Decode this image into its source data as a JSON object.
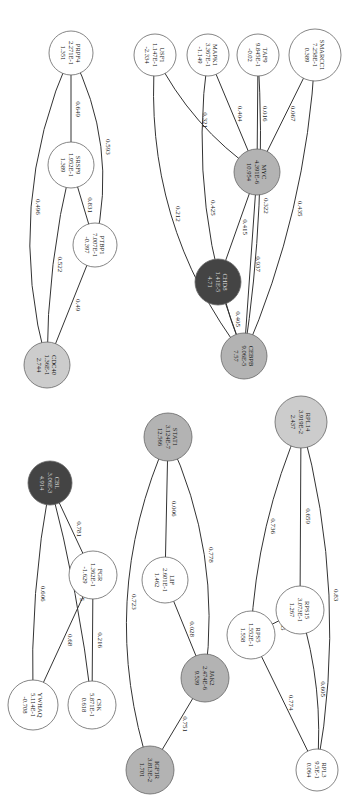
{
  "diagram": {
    "title": "",
    "orientation": "rotated-90",
    "colors": {
      "white": "#ffffff",
      "light": "#cccccc",
      "gray": "#b3b3b3",
      "dark": "#444444",
      "text_dark": "#111111",
      "text_light": "#dddddd"
    },
    "nodes": [
      {
        "id": "PRPF4",
        "pvalue": "2.271E-1",
        "score": "1.351",
        "fill": "white"
      },
      {
        "id": "SRSF9",
        "pvalue": "1.952E-1",
        "score": "1.389",
        "fill": "white"
      },
      {
        "id": "PTBP1",
        "pvalue": "7.007E-1",
        "score": "-0.397",
        "fill": "white"
      },
      {
        "id": "CDC40",
        "pvalue": "1.36E-1",
        "score": "2.744",
        "fill": "light"
      },
      {
        "id": "USF1",
        "pvalue": "1.147E-1",
        "score": "-2.334",
        "fill": "white"
      },
      {
        "id": "MAPK1",
        "pvalue": "3.367E-1",
        "score": "-1.149",
        "fill": "white"
      },
      {
        "id": "TAF9",
        "pvalue": "9.845E-1",
        "score": "-0.02",
        "fill": "white"
      },
      {
        "id": "SMARCC1",
        "pvalue": "7.258E-1",
        "score": "0.389",
        "fill": "white"
      },
      {
        "id": "MYC",
        "pvalue": "4.391E-6",
        "score": "10.954",
        "fill": "gray"
      },
      {
        "id": "CHD8",
        "pvalue": "1.41E-5",
        "score": "4.71",
        "fill": "dark"
      },
      {
        "id": "CEBPB",
        "pvalue": "9.06E-5",
        "score": "7.57",
        "fill": "gray"
      },
      {
        "id": "CBL",
        "pvalue": "3.06E-3",
        "score": "4.914",
        "fill": "dark"
      },
      {
        "id": "FGR",
        "pvalue": "1.362E-1",
        "score": "-1.629",
        "fill": "white"
      },
      {
        "id": "YWHAQ",
        "pvalue": "5.114E-1",
        "score": "-0.708",
        "fill": "white"
      },
      {
        "id": "CSK",
        "pvalue": "5.871E-1",
        "score": "0.618",
        "fill": "white"
      },
      {
        "id": "STAT1",
        "pvalue": "3.124E-7",
        "score": "12.566",
        "fill": "gray"
      },
      {
        "id": "LIF",
        "pvalue": "2.601E-1",
        "score": "1.462",
        "fill": "white"
      },
      {
        "id": "JAK2",
        "pvalue": "2.474E-6",
        "score": "9.539",
        "fill": "gray"
      },
      {
        "id": "IGF1R",
        "pvalue": "3.813E-2",
        "score": "1.701",
        "fill": "gray"
      },
      {
        "id": "RPL14",
        "pvalue": "3.919E-2",
        "score": "2.437",
        "fill": "light"
      },
      {
        "id": "RPS15",
        "pvalue": "3.073E-1",
        "score": "1.267",
        "fill": "white"
      },
      {
        "id": "RPS5",
        "pvalue": "1.552E-1",
        "score": "1.558",
        "fill": "white"
      },
      {
        "id": "RPL3",
        "pvalue": "9.5E-1",
        "score": "0.064",
        "fill": "white"
      }
    ],
    "edges": [
      {
        "source": "PRPF4",
        "target": "SRSF9",
        "weight": "0.649"
      },
      {
        "source": "PRPF4",
        "target": "PTBP1",
        "weight": "0.593"
      },
      {
        "source": "PRPF4",
        "target": "CDC40",
        "weight": "0.496"
      },
      {
        "source": "SRSF9",
        "target": "PTBP1",
        "weight": "0.831"
      },
      {
        "source": "SRSF9",
        "target": "CDC40",
        "weight": "0.522"
      },
      {
        "source": "PTBP1",
        "target": "CDC40",
        "weight": "0.49"
      },
      {
        "source": "USF1",
        "target": "MYC",
        "weight": "0.321"
      },
      {
        "source": "USF1",
        "target": "CEBPB",
        "weight": "0.212"
      },
      {
        "source": "MAPK1",
        "target": "MYC",
        "weight": "0.404"
      },
      {
        "source": "MAPK1",
        "target": "CEBPB",
        "weight": "0.425"
      },
      {
        "source": "TAF9",
        "target": "MYC",
        "weight": "0.016"
      },
      {
        "source": "TAF9",
        "target": "CEBPB",
        "weight": "0.322"
      },
      {
        "source": "SMARCC1",
        "target": "MYC",
        "weight": "0.067"
      },
      {
        "source": "SMARCC1",
        "target": "CEBPB",
        "weight": "0.435"
      },
      {
        "source": "MYC",
        "target": "CHD8",
        "weight": "0.415"
      },
      {
        "source": "MYC",
        "target": "CEBPB",
        "weight": "0.937"
      },
      {
        "source": "CHD8",
        "target": "CEBPB",
        "weight": "0.405"
      },
      {
        "source": "CBL",
        "target": "FGR",
        "weight": "0.781"
      },
      {
        "source": "CBL",
        "target": "YWHAQ",
        "weight": "0.606"
      },
      {
        "source": "CBL",
        "target": "CSK",
        "weight": "0.075"
      },
      {
        "source": "FGR",
        "target": "YWHAQ",
        "weight": "0.68"
      },
      {
        "source": "FGR",
        "target": "CSK",
        "weight": "0.216"
      },
      {
        "source": "STAT1",
        "target": "LIF",
        "weight": "0.006"
      },
      {
        "source": "STAT1",
        "target": "JAK2",
        "weight": "0.778"
      },
      {
        "source": "STAT1",
        "target": "IGF1R",
        "weight": "0.723"
      },
      {
        "source": "LIF",
        "target": "JAK2",
        "weight": "0.028"
      },
      {
        "source": "JAK2",
        "target": "IGF1R",
        "weight": "0.751"
      },
      {
        "source": "RPL14",
        "target": "RPS15",
        "weight": "0.659"
      },
      {
        "source": "RPL14",
        "target": "RPS5",
        "weight": "0.736"
      },
      {
        "source": "RPL14",
        "target": "RPL3",
        "weight": "0.83"
      },
      {
        "source": "RPS15",
        "target": "RPS5",
        "weight": "0.705"
      },
      {
        "source": "RPS15",
        "target": "RPL3",
        "weight": "0.605"
      },
      {
        "source": "RPS5",
        "target": "RPL3",
        "weight": "0.774"
      }
    ]
  }
}
